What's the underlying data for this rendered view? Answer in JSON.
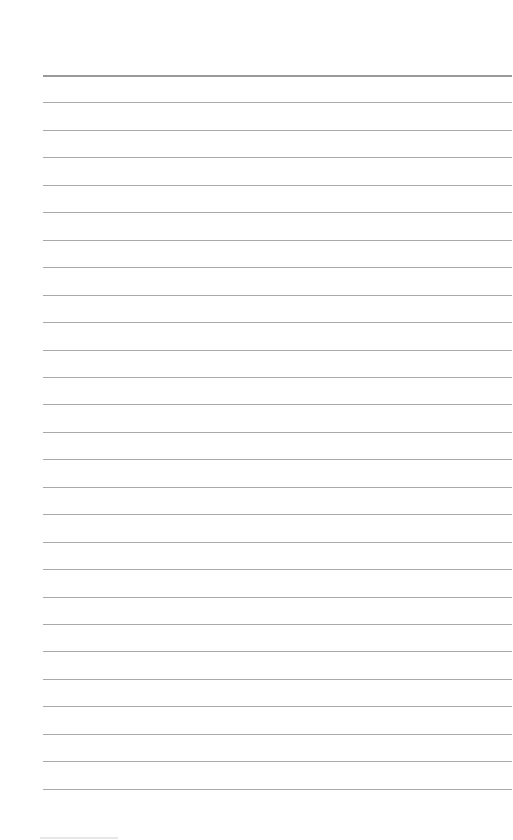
{
  "page": {
    "type": "lined-paper",
    "background": "#ffffff",
    "rule_color": "#a9a9a9",
    "top_rule_color": "#9a9a9a",
    "rule_left": 43,
    "rule_right": 512,
    "first_rule_y": 75,
    "rule_spacing": 27.45,
    "rule_count": 27
  }
}
